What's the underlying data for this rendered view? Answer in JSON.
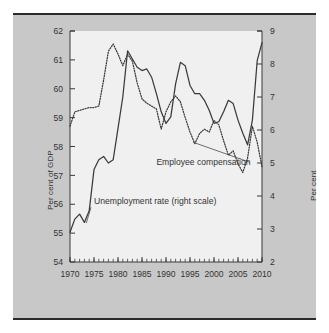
{
  "figure": {
    "background": "#c8c8c8",
    "plot_background": "#f0f0f0",
    "border_color": "#2b2b2b",
    "line_color": "#3a3a3a",
    "text_color": "#333333"
  },
  "labels": {
    "y_left_title": "Per cent of GDP",
    "y_right_title": "Per cent"
  },
  "chart_data": {
    "type": "line",
    "title": "",
    "xlabel": "",
    "ylabel": "Per cent of GDP",
    "y2label": "Per cent",
    "xlim": [
      1970,
      2010
    ],
    "ylim": [
      54,
      62
    ],
    "y2lim": [
      2,
      9
    ],
    "grid": false,
    "legend": "annotations-on-plot",
    "xticks": [
      1970,
      1975,
      1980,
      1985,
      1990,
      1995,
      2000,
      2005,
      2010
    ],
    "xtick_labels": [
      "1970",
      "1975",
      "1980",
      "1985",
      "1990",
      "1995",
      "2000",
      "2005",
      "2010"
    ],
    "x_minor_tick_interval": 1,
    "yticks": [
      54,
      55,
      56,
      57,
      58,
      59,
      60,
      61,
      62
    ],
    "ytick_labels": [
      "54",
      "55",
      "56",
      "57",
      "58",
      "59",
      "60",
      "61",
      "62"
    ],
    "y2ticks": [
      2,
      3,
      4,
      5,
      6,
      7,
      8,
      9
    ],
    "y2tick_labels": [
      "2",
      "3",
      "4",
      "5",
      "6",
      "7",
      "8",
      "9"
    ],
    "annotations": [
      {
        "text": "Employee compensation",
        "x_text": 1988.0,
        "y_text": 57.35,
        "leader_to_x": 1995.6,
        "leader_to_y": 58.15,
        "axis": "left"
      },
      {
        "text": "Unemployment rate (right scale)",
        "x_text": 1975.0,
        "y_text": 56.0,
        "leader_to_x": 1973.4,
        "leader_to_y": 55.35,
        "axis": "left"
      }
    ],
    "series": [
      {
        "name": "Employee compensation",
        "axis": "left",
        "units": "Per cent of GDP",
        "style": "dotted",
        "x": [
          1970,
          1971,
          1972,
          1973,
          1974,
          1975,
          1976,
          1977,
          1978,
          1979,
          1980,
          1981,
          1982,
          1983,
          1984,
          1985,
          1986,
          1987,
          1988,
          1989,
          1990,
          1991,
          1992,
          1993,
          1994,
          1995,
          1996,
          1997,
          1998,
          1999,
          2000,
          2001,
          2002,
          2003,
          2004,
          2005,
          2006,
          2007,
          2008,
          2009,
          2010
        ],
        "values": [
          58.7,
          59.2,
          59.25,
          59.3,
          59.35,
          59.35,
          59.4,
          60.3,
          61.3,
          61.55,
          61.2,
          60.8,
          61.2,
          60.95,
          60.2,
          59.65,
          59.5,
          59.4,
          59.3,
          58.6,
          59.2,
          59.55,
          59.75,
          59.55,
          59.0,
          58.5,
          58.1,
          58.45,
          58.6,
          58.5,
          58.9,
          58.75,
          58.2,
          57.7,
          57.85,
          57.4,
          57.1,
          57.6,
          58.7,
          58.15,
          57.3
        ]
      },
      {
        "name": "Unemployment rate (right scale)",
        "axis": "right",
        "units": "Per cent",
        "style": "solid",
        "x": [
          1970,
          1971,
          1972,
          1973,
          1974,
          1975,
          1976,
          1977,
          1978,
          1979,
          1980,
          1981,
          1982,
          1983,
          1984,
          1985,
          1986,
          1987,
          1988,
          1989,
          1990,
          1991,
          1992,
          1993,
          1994,
          1995,
          1996,
          1997,
          1998,
          1999,
          2000,
          2001,
          2002,
          2003,
          2004,
          2005,
          2006,
          2007,
          2008,
          2009,
          2010
        ],
        "values": [
          2.9,
          3.3,
          3.45,
          3.2,
          3.55,
          4.8,
          5.1,
          5.2,
          5.0,
          5.1,
          6.05,
          7.0,
          8.4,
          8.15,
          7.9,
          7.8,
          7.85,
          7.6,
          7.1,
          6.55,
          6.2,
          6.4,
          7.4,
          8.05,
          7.95,
          7.35,
          7.1,
          7.1,
          6.9,
          6.6,
          6.2,
          6.25,
          6.55,
          6.9,
          6.8,
          6.3,
          5.9,
          5.55,
          6.3,
          8.1,
          8.65
        ]
      }
    ]
  }
}
